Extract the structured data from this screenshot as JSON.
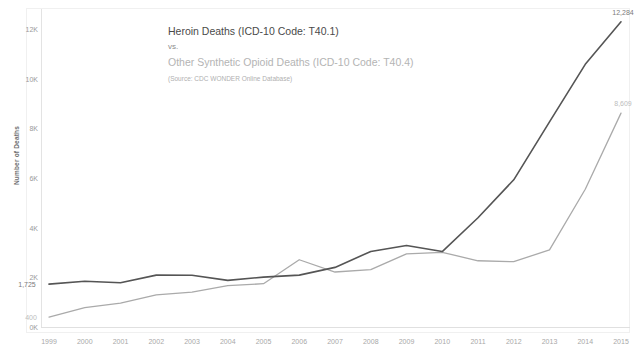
{
  "title": {
    "main": "Heroin Deaths (ICD-10 Code: T40.1)",
    "vs": "vs.",
    "sub": "Other Synthetic Opioid Deaths (ICD-10 Code: T40.4)",
    "source": "(Source: CDC WONDER Online Database)"
  },
  "axis": {
    "ylabel": "Number of Deaths",
    "yticks": [
      "0K",
      "2K",
      "4K",
      "6K",
      "8K",
      "10K",
      "12K"
    ],
    "ytick_values": [
      0,
      2000,
      4000,
      6000,
      8000,
      10000,
      12000
    ]
  },
  "labels": {
    "heroin_start": "1,725",
    "heroin_end": "12,284",
    "synthetic_start": "400",
    "synthetic_end": "8,609"
  },
  "colors": {
    "heroin": "#555555",
    "synthetic": "#aaaaaa",
    "axis": "#e0e0e0",
    "tick_text": "#a0a0a0",
    "background": "#ffffff"
  },
  "chart_data": {
    "type": "line",
    "title": "Heroin Deaths (ICD-10 Code: T40.1) vs. Other Synthetic Opioid Deaths (ICD-10 Code: T40.4)",
    "subtitle": "(Source: CDC WONDER Online Database)",
    "xlabel": "",
    "ylabel": "Number of Deaths",
    "xlim": [
      1999,
      2015
    ],
    "ylim": [
      0,
      12800
    ],
    "grid": false,
    "legend": "none",
    "categories": [
      "1999",
      "2000",
      "2001",
      "2002",
      "2003",
      "2004",
      "2005",
      "2006",
      "2007",
      "2008",
      "2009",
      "2010",
      "2011",
      "2012",
      "2013",
      "2014",
      "2015"
    ],
    "series": [
      {
        "name": "Heroin Deaths (ICD-10 Code: T40.1)",
        "color": "#555555",
        "values": [
          1725,
          1842,
          1779,
          2089,
          2080,
          1878,
          2009,
          2088,
          2399,
          3041,
          3278,
          3036,
          4397,
          5925,
          8257,
          10574,
          12284
        ],
        "endpoint_labels": {
          "start": "1,725",
          "end": "12,284"
        }
      },
      {
        "name": "Other Synthetic Opioid Deaths (ICD-10 Code: T40.4)",
        "color": "#aaaaaa",
        "values": [
          400,
          782,
          957,
          1295,
          1400,
          1664,
          1742,
          2707,
          2213,
          2306,
          2946,
          3007,
          2666,
          2628,
          3105,
          5544,
          8609
        ],
        "endpoint_labels": {
          "start": "400",
          "end": "8,609"
        }
      }
    ]
  }
}
